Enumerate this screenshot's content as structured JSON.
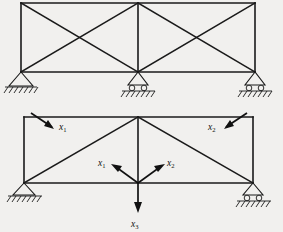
{
  "figure": {
    "background_color": "#f1f0ee",
    "line_color": "#1a1a1a"
  },
  "trusses": [
    {
      "name": "upper-truss",
      "description": "Two-bay cross-braced truss on three supports",
      "geometry": {
        "left_x": 21,
        "center_x": 138,
        "right_x": 255,
        "top_y": 3,
        "bottom_y": 72
      },
      "supports": [
        {
          "name": "support-left",
          "type": "pinned",
          "x": 21,
          "y": 72
        },
        {
          "name": "support-center",
          "type": "roller",
          "x": 138,
          "y": 72
        },
        {
          "name": "support-right",
          "type": "roller",
          "x": 255,
          "y": 72
        }
      ],
      "members": [
        "top-chord",
        "bottom-chord",
        "left-vertical",
        "center-vertical",
        "right-vertical",
        "bay1-diagonal-a",
        "bay1-diagonal-b",
        "bay2-diagonal-a",
        "bay2-diagonal-b"
      ]
    },
    {
      "name": "lower-truss",
      "description": "Two-bay truss with apex center post and three applied forces",
      "geometry": {
        "left_x": 24,
        "center_x": 138,
        "right_x": 253,
        "top_y": 117,
        "bottom_y": 183
      },
      "supports": [
        {
          "name": "support-left",
          "type": "pinned",
          "x": 24,
          "y": 183
        },
        {
          "name": "support-right",
          "type": "roller",
          "x": 253,
          "y": 183
        }
      ],
      "members": [
        "top-chord",
        "bottom-chord",
        "left-vertical",
        "center-vertical",
        "right-vertical",
        "left-diagonal",
        "right-diagonal"
      ]
    }
  ],
  "forces": [
    {
      "name": "force-top-left",
      "label": "x",
      "subscript": "1",
      "direction": "down-right",
      "applied_at": "upper-left-node",
      "tail": {
        "x": 30,
        "y": 113
      },
      "head": {
        "x": 52,
        "y": 127
      }
    },
    {
      "name": "force-top-right",
      "label": "x",
      "subscript": "2",
      "direction": "down-left",
      "applied_at": "upper-right-node",
      "tail": {
        "x": 248,
        "y": 113
      },
      "head": {
        "x": 226,
        "y": 127
      }
    },
    {
      "name": "force-center-left",
      "label": "x",
      "subscript": "1",
      "direction": "up-left",
      "applied_at": "center-node",
      "tail": {
        "x": 138,
        "y": 183
      },
      "head": {
        "x": 113,
        "y": 165
      }
    },
    {
      "name": "force-center-right",
      "label": "x",
      "subscript": "2",
      "direction": "up-right",
      "applied_at": "center-node",
      "tail": {
        "x": 138,
        "y": 183
      },
      "head": {
        "x": 163,
        "y": 165
      }
    },
    {
      "name": "force-center-down",
      "label": "x",
      "subscript": "3",
      "direction": "down",
      "applied_at": "center-node",
      "tail": {
        "x": 138,
        "y": 183
      },
      "head": {
        "x": 138,
        "y": 212
      }
    }
  ],
  "labels": {
    "top_left": {
      "base": "x",
      "sub": "1"
    },
    "top_right": {
      "base": "x",
      "sub": "2"
    },
    "center_left": {
      "base": "x",
      "sub": "1"
    },
    "center_right": {
      "base": "x",
      "sub": "2"
    },
    "center_down": {
      "base": "x",
      "sub": "3"
    }
  }
}
